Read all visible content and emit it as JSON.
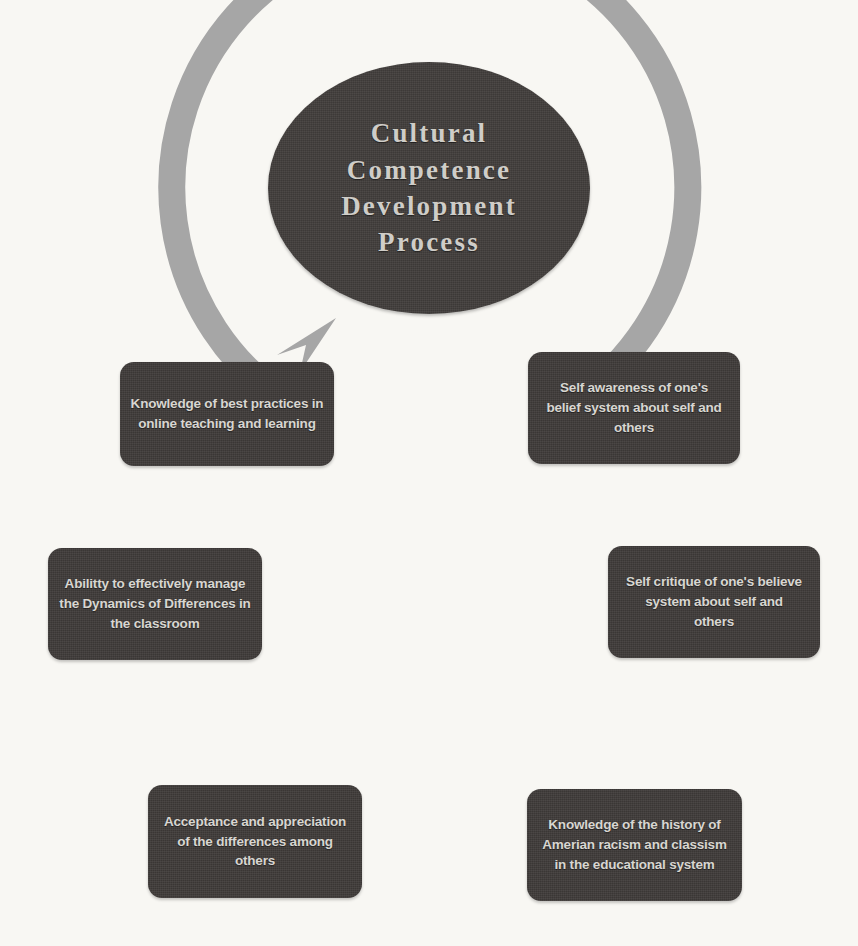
{
  "diagram": {
    "title": "Cultural Competence Development Process",
    "type": "cycle",
    "direction": "counterclockwise",
    "background_color": "#f8f7f3",
    "node_color": "#3e3a38",
    "text_color": "#d8d6d1",
    "ring_color": "#a6a6a6",
    "center": {
      "label": "Cultural\nCompetence\nDevelopment\nProcess"
    },
    "nodes": [
      {
        "id": "self-awareness",
        "position": "top-right",
        "label": "Self awareness of one's belief system about self and others"
      },
      {
        "id": "self-critique",
        "position": "right",
        "label": "Self critique of one's believe system about self and others"
      },
      {
        "id": "history-racism",
        "position": "bottom-right",
        "label": "Knowledge of the history of Amerian racism and classism in the educational system"
      },
      {
        "id": "acceptance",
        "position": "bottom-left",
        "label": "Acceptance and appreciation of the differences among others"
      },
      {
        "id": "dynamics",
        "position": "left",
        "label": "Abilitty to effectively manage the Dynamics of Differences in the classroom"
      },
      {
        "id": "best-practices",
        "position": "top-left",
        "label": "Knowledge of best practices in online teaching and learning"
      }
    ]
  }
}
